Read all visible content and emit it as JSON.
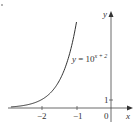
{
  "chart_data": {
    "type": "line",
    "title": "",
    "equation_label": "y = 10",
    "equation_exponent": "x + 2",
    "xlabel": "x",
    "ylabel": "y",
    "x_ticks": [
      "−2",
      "−1"
    ],
    "x_tick_values": [
      -2,
      -1
    ],
    "y_ticks": [
      "1"
    ],
    "y_tick_values": [
      1
    ],
    "origin_label": "0",
    "xlim": [
      -2.9,
      0.6
    ],
    "ylim": [
      0,
      12
    ],
    "grid": false,
    "series": [
      {
        "name": "y = 10^(x+2)",
        "x": [
          -2.9,
          -2.5,
          -2.0,
          -1.75,
          -1.5,
          -1.25,
          -1.0
        ],
        "y": [
          0.13,
          0.32,
          1.0,
          1.78,
          3.16,
          5.62,
          10.0
        ]
      }
    ]
  }
}
